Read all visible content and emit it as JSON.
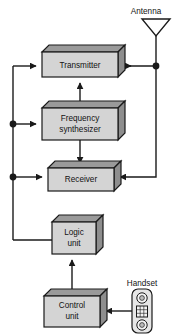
{
  "diagram": {
    "colors": {
      "box_front": "#d4d4d4",
      "box_top": "#9a9a9a",
      "box_side": "#8e8e8e",
      "outline": "#1a1a1a",
      "wire": "#1a1a1a",
      "background": "#ffffff",
      "text": "#121212"
    },
    "blocks": [
      {
        "id": "transmitter",
        "label": "Transmitter",
        "lines": [
          "Transmitter"
        ],
        "x": 42,
        "y": 52,
        "w": 76,
        "h": 25,
        "depth": 7
      },
      {
        "id": "frequency-synthesizer",
        "label": "Frequency synthesizer",
        "lines": [
          "Frequency",
          "synthesizer"
        ],
        "x": 42,
        "y": 108,
        "w": 76,
        "h": 32,
        "depth": 7
      },
      {
        "id": "receiver",
        "label": "Receiver",
        "lines": [
          "Receiver"
        ],
        "x": 48,
        "y": 168,
        "w": 66,
        "h": 23,
        "depth": 7
      },
      {
        "id": "logic-unit",
        "label": "Logic unit",
        "lines": [
          "Logic",
          "unit"
        ],
        "x": 52,
        "y": 222,
        "w": 44,
        "h": 32,
        "depth": 7
      },
      {
        "id": "control-unit",
        "label": "Control unit",
        "lines": [
          "Control",
          "unit"
        ],
        "x": 44,
        "y": 296,
        "w": 56,
        "h": 31,
        "depth": 7
      }
    ],
    "external_labels": [
      {
        "id": "antenna-label",
        "text": "Antenna",
        "x": 146,
        "y": 11
      },
      {
        "id": "handset-label",
        "text": "Handset",
        "x": 142,
        "y": 283
      }
    ],
    "junctions": [
      {
        "id": "junction-left-upper",
        "x": 13,
        "y": 124
      },
      {
        "id": "junction-left-lower",
        "x": 13,
        "y": 177
      },
      {
        "id": "junction-antenna-feed",
        "x": 156,
        "y": 66
      }
    ],
    "antenna": {
      "id": "antenna-symbol",
      "apex_x": 156,
      "apex_y": 36,
      "left_x": 142,
      "right_x": 170,
      "top_y": 19,
      "mast_bottom_y": 66
    },
    "handset": {
      "id": "handset-symbol",
      "x": 132,
      "y": 289,
      "w": 20,
      "h": 44,
      "earpiece": "speaker-circle",
      "keypad": "keypad-grid",
      "mouthpiece": "microphone-circle"
    },
    "connections": [
      {
        "id": "transmitter-to-antenna",
        "from": "transmitter",
        "to": "antenna",
        "arrow": "right"
      },
      {
        "id": "antenna-to-receiver",
        "from": "antenna",
        "to": "receiver",
        "arrow": "left"
      },
      {
        "id": "synthesizer-to-transmitter",
        "from": "frequency-synthesizer",
        "to": "transmitter",
        "arrow": "up"
      },
      {
        "id": "synthesizer-to-receiver",
        "from": "frequency-synthesizer",
        "to": "receiver",
        "arrow": "down"
      },
      {
        "id": "logic-to-transmitter",
        "from": "logic-unit",
        "to": "transmitter",
        "arrow": "right"
      },
      {
        "id": "logic-to-synthesizer",
        "from": "logic-unit",
        "to": "frequency-synthesizer",
        "arrow": "right"
      },
      {
        "id": "logic-to-receiver",
        "from": "logic-unit",
        "to": "receiver",
        "arrow": "right"
      },
      {
        "id": "control-to-logic",
        "from": "control-unit",
        "to": "logic-unit",
        "arrow": "up"
      },
      {
        "id": "handset-to-control",
        "from": "handset",
        "to": "control-unit",
        "arrow": "left"
      }
    ]
  }
}
